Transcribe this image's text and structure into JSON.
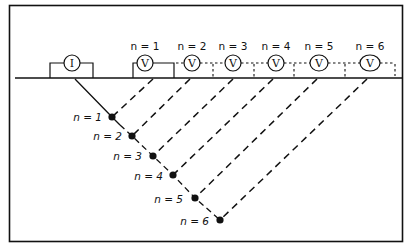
{
  "diagram": {
    "type": "dipole-dipole pseudosection electrode array",
    "frame_color": "#111111",
    "line_color": "#111111",
    "current_electrode": {
      "symbol": "I",
      "label": "current-electrode"
    },
    "potential_electrodes": [
      {
        "symbol": "V",
        "label": "n = 1"
      },
      {
        "symbol": "V",
        "label": "n = 2"
      },
      {
        "symbol": "V",
        "label": "n = 3"
      },
      {
        "symbol": "V",
        "label": "n = 4"
      },
      {
        "symbol": "V",
        "label": "n = 5"
      },
      {
        "symbol": "V",
        "label": "n = 6"
      }
    ],
    "plot_points": [
      {
        "label": "n = 1"
      },
      {
        "label": "n = 2"
      },
      {
        "label": "n = 3"
      },
      {
        "label": "n = 4"
      },
      {
        "label": "n = 5"
      },
      {
        "label": "n = 6"
      }
    ]
  }
}
